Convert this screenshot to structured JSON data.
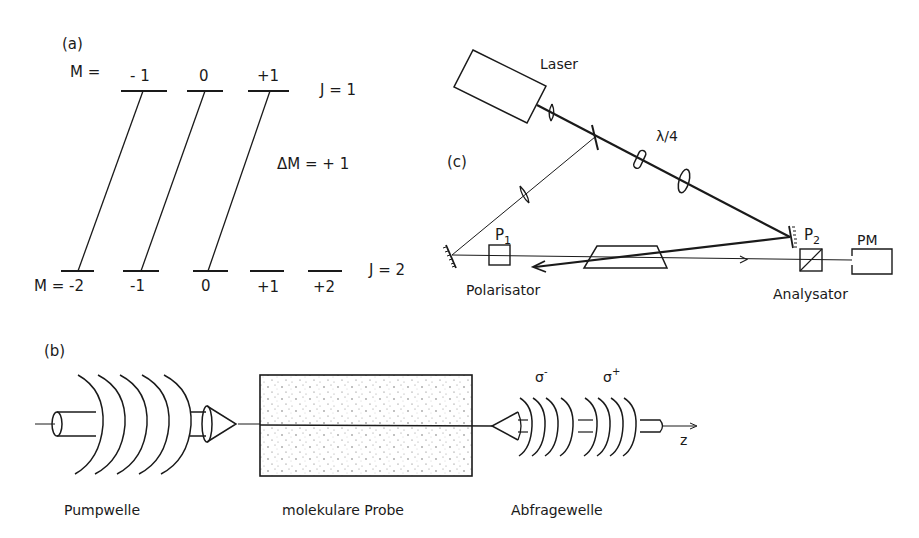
{
  "panel_a": {
    "label": "(a)",
    "upper_prefix": "M =",
    "upper_levels": [
      "- 1",
      "0",
      "+1"
    ],
    "upper_J": "J = 1",
    "transition": "ΔM = + 1",
    "lower_prefix": "M = -2",
    "lower_levels": [
      "-1",
      "0",
      "+1",
      "+2"
    ],
    "lower_J": "J = 2"
  },
  "panel_c": {
    "label": "(c)",
    "laser": "Laser",
    "waveplate": "λ/4",
    "p1": "P",
    "p1_sub": "1",
    "p2": "P",
    "p2_sub": "2",
    "pm": "PM",
    "polarizer": "Polarisator",
    "analyzer": "Analysator"
  },
  "panel_b": {
    "label": "(b)",
    "sigma_minus": "σ",
    "sigma_minus_sup": "-",
    "sigma_plus": "σ",
    "sigma_plus_sup": "+",
    "axis": "z",
    "pump": "Pumpwelle",
    "sample": "molekulare Probe",
    "probe": "Abfragewelle"
  }
}
